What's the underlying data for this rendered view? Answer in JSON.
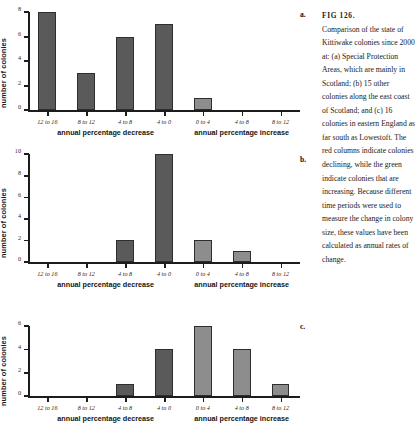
{
  "figure": {
    "number_label": "FIG 126.",
    "caption": "Comparison of the state of Kittiwake colonies since 2000 at: (a) Special Protection Areas, which are mainly in Scotland; (b) 15 other colonies along the east coast of Scotland; and (c) 16 colonies in eastern England as far south as Lowestoft. The red columns indicate colonies declining, while the green indicate colonies that are increasing. Because different time periods were used to measure the change in colony size, these values have been calculated as annual rates of change.",
    "panel_letters": {
      "a": "a.",
      "b": "b.",
      "c": "c."
    },
    "colors": {
      "decrease_bar": "#5a5a5a",
      "increase_bar": "#8d8d8d",
      "axis": "#1c1c1c",
      "text": "#1a1a1a",
      "background": "#ffffff"
    }
  },
  "chart_data": [
    {
      "type": "bar",
      "panel": "a",
      "title": "",
      "xlabel": "",
      "ylabel": "number of colonies",
      "ylim": [
        0,
        8
      ],
      "yticks": [
        0,
        2,
        4,
        6,
        8
      ],
      "ytick_labels": [
        "0",
        "2",
        "4",
        "6",
        "8"
      ],
      "grid": false,
      "legend": false,
      "categories": [
        "12 to 16",
        "8 to 12",
        "4 to 8",
        "4 to 0",
        "0 to 4",
        "4 to 8",
        "8 to 12"
      ],
      "values": [
        8,
        3,
        6,
        7,
        1,
        0,
        0
      ],
      "group_labels": [
        "annual percentage decrease",
        "annual percentage increase"
      ],
      "groups": [
        "decrease",
        "decrease",
        "decrease",
        "decrease",
        "increase",
        "increase",
        "increase"
      ]
    },
    {
      "type": "bar",
      "panel": "b",
      "title": "",
      "xlabel": "",
      "ylabel": "number of colonies",
      "ylim": [
        0,
        10
      ],
      "yticks": [
        0,
        2,
        4,
        6,
        8,
        10
      ],
      "ytick_labels": [
        "0",
        "2",
        "4",
        "6",
        "8",
        "10"
      ],
      "grid": false,
      "legend": false,
      "categories": [
        "12 to 16",
        "8 to 12",
        "4 to 8",
        "4 to 0",
        "0 to 4",
        "4 to 8",
        "8 to 12"
      ],
      "values": [
        0,
        0,
        2,
        10,
        2,
        1,
        0
      ],
      "group_labels": [
        "annual percentage decrease",
        "annual percentage increase"
      ],
      "groups": [
        "decrease",
        "decrease",
        "decrease",
        "decrease",
        "increase",
        "increase",
        "increase"
      ]
    },
    {
      "type": "bar",
      "panel": "c",
      "title": "",
      "xlabel": "",
      "ylabel": "number of colonies",
      "ylim": [
        0,
        6
      ],
      "yticks": [
        0,
        2,
        4,
        6
      ],
      "ytick_labels": [
        "0",
        "2",
        "4",
        "6"
      ],
      "grid": false,
      "legend": false,
      "categories": [
        "12 to 16",
        "8 to 12",
        "4 to 8",
        "4 to 0",
        "0 to 4",
        "4 to 8",
        "8 to 12"
      ],
      "values": [
        0,
        0,
        1,
        4,
        6,
        4,
        1
      ],
      "group_labels": [
        "annual percentage decrease",
        "annual percentage increase"
      ],
      "groups": [
        "decrease",
        "decrease",
        "decrease",
        "decrease",
        "increase",
        "increase",
        "increase"
      ]
    }
  ]
}
